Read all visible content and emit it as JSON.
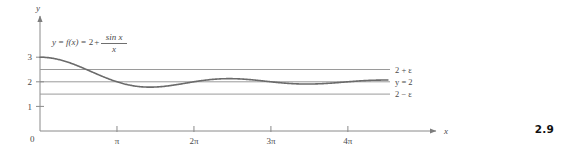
{
  "figure": {
    "number": "2.9",
    "curve_label_parts": {
      "lhs": "y",
      "eq1": "=",
      "fx": "f(x)",
      "eq2": "=",
      "const": "2",
      "plus": "+",
      "frac_num": "sin x",
      "frac_den": "x"
    },
    "axes": {
      "x_name": "x",
      "y_name": "y",
      "origin_label": "0"
    }
  },
  "chart_data": {
    "type": "line",
    "title": "",
    "xlabel": "x",
    "ylabel": "y",
    "function": "y = f(x) = 2 + sin(x)/x",
    "grid": false,
    "legend": "none",
    "xlim": [
      0,
      14.2
    ],
    "ylim": [
      0,
      3.45
    ],
    "x_ticks": [
      {
        "value": 3.14159,
        "label": "π"
      },
      {
        "value": 6.28319,
        "label": "2π"
      },
      {
        "value": 9.42478,
        "label": "3π"
      },
      {
        "value": 12.56637,
        "label": "4π"
      }
    ],
    "y_ticks": [
      {
        "value": 1,
        "label": "1"
      },
      {
        "value": 2,
        "label": "2"
      },
      {
        "value": 3,
        "label": "3"
      }
    ],
    "reference_lines": [
      {
        "name": "upper-bound",
        "value": 2.5,
        "label": "2 + ε"
      },
      {
        "name": "limit",
        "value": 2.0,
        "label": "y = 2"
      },
      {
        "name": "lower-bound",
        "value": 1.5,
        "label": "2 − ε"
      }
    ],
    "series": [
      {
        "name": "f(x) = 2 + sin(x)/x",
        "x_start": 0.0,
        "x_end": 14.2,
        "y_start": 3.0,
        "y_end": 2.07,
        "key_points": [
          {
            "x": 0.0,
            "y": 3.0,
            "note": "limit as x approaches 0"
          },
          {
            "x": 3.14159,
            "y": 2.0,
            "note": "crosses y = 2"
          },
          {
            "x": 4.493,
            "y": 1.783,
            "note": "minimum"
          },
          {
            "x": 6.28319,
            "y": 2.0,
            "note": "crosses y = 2"
          },
          {
            "x": 7.725,
            "y": 2.128,
            "note": "maximum"
          },
          {
            "x": 9.42478,
            "y": 2.0,
            "note": "crosses y = 2"
          },
          {
            "x": 10.904,
            "y": 1.908,
            "note": "minimum"
          },
          {
            "x": 12.56637,
            "y": 2.0,
            "note": "crosses y = 2"
          },
          {
            "x": 14.2,
            "y": 2.07,
            "note": "endpoint"
          }
        ]
      }
    ],
    "colors": {
      "curve": "#6b6b6b",
      "axis": "#8a8a8a",
      "reference_line": "#9a9a9a",
      "text": "#4a4a4a",
      "background": "#ffffff"
    }
  }
}
